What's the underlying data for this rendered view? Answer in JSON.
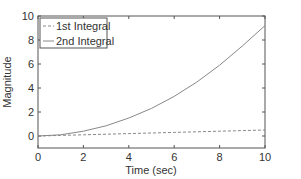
{
  "chart_data": {
    "type": "line",
    "title": "",
    "xlabel": "Time (sec)",
    "ylabel": "Magnitude",
    "xlim": [
      0,
      10
    ],
    "ylim": [
      -1,
      10
    ],
    "xticks": [
      0,
      2,
      4,
      6,
      8,
      10
    ],
    "yticks": [
      0,
      2,
      4,
      6,
      8,
      10
    ],
    "grid": false,
    "legend_position": "upper-left",
    "x": [
      0,
      1,
      2,
      3,
      4,
      5,
      6,
      7,
      8,
      9,
      10
    ],
    "series": [
      {
        "name": "1st Integral",
        "style": "dashed",
        "color": "#888888",
        "values": [
          0,
          0.05,
          0.1,
          0.15,
          0.2,
          0.25,
          0.3,
          0.35,
          0.4,
          0.45,
          0.5
        ]
      },
      {
        "name": "2nd Integral",
        "style": "solid",
        "color": "#888888",
        "values": [
          0,
          0.1,
          0.4,
          0.85,
          1.5,
          2.3,
          3.3,
          4.5,
          5.9,
          7.5,
          9.2
        ]
      }
    ]
  }
}
